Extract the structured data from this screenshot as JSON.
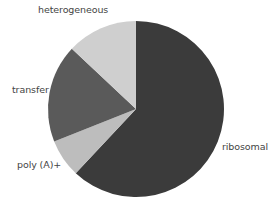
{
  "chart_data": {
    "type": "pie",
    "title": "",
    "categories": [
      "ribosomal",
      "poly (A)+",
      "transfer",
      "heterogeneous"
    ],
    "values": [
      62,
      7,
      18,
      13
    ],
    "units": "percent (estimated from slice angles)",
    "start_angle": "12 o'clock, clockwise",
    "colors": [
      "#3b3b3b",
      "#bdbdbd",
      "#5a5a5a",
      "#cfcfcf"
    ],
    "legend": "none (direct labels)",
    "labels": {
      "ribosomal": "ribosomal",
      "polya": "poly (A)+",
      "transfer": "transfer",
      "heterogeneous": "heterogeneous"
    }
  },
  "geometry": {
    "cx": 136,
    "cy": 109,
    "r": 88
  }
}
